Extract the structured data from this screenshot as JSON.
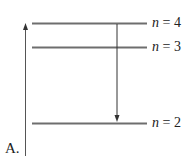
{
  "diagram": {
    "option_label": "A.",
    "levels": [
      {
        "n": "4",
        "label_var": "n",
        "label_eq": " = 4",
        "y": 23
      },
      {
        "n": "3",
        "label_var": "n",
        "label_eq": " = 3",
        "y": 47
      },
      {
        "n": "2",
        "label_var": "n",
        "label_eq": " = 2",
        "y": 123
      }
    ],
    "transition": {
      "from": "n = 4",
      "to": "n = 2",
      "direction": "down"
    },
    "energy_axis": {
      "direction": "up"
    },
    "colors": {
      "level_line": "#6e6e6e",
      "arrow": "#333333",
      "text": "#222222"
    }
  }
}
